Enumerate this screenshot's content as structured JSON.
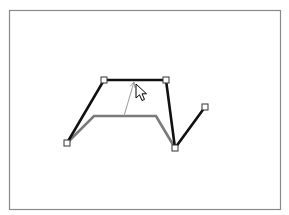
{
  "diagram": {
    "frame": {
      "x": 9,
      "y": 10,
      "width": 271,
      "height": 199,
      "stroke": "#8a8a8a"
    },
    "new_path": {
      "color": "#111111",
      "width": 2.6,
      "points": [
        [
          67,
          143
        ],
        [
          104,
          80
        ],
        [
          166,
          80
        ],
        [
          175,
          148
        ],
        [
          205,
          107
        ]
      ]
    },
    "original_path": {
      "color": "#7a7a7a",
      "width": 2.6,
      "points": [
        [
          67,
          143
        ],
        [
          94,
          116
        ],
        [
          156,
          116
        ],
        [
          175,
          148
        ]
      ]
    },
    "handles": {
      "size": 6,
      "fill": "#ffffff",
      "stroke": "#333333",
      "points": [
        [
          67,
          143
        ],
        [
          104,
          80
        ],
        [
          166,
          80
        ],
        [
          175,
          148
        ],
        [
          205,
          107
        ]
      ]
    },
    "drag_indicator": {
      "color": "#9a9a9a",
      "from": [
        124,
        116
      ],
      "to": [
        134,
        82
      ]
    },
    "cursor": {
      "icon": "arrow-pointer-icon",
      "tip": [
        136,
        84
      ]
    }
  }
}
